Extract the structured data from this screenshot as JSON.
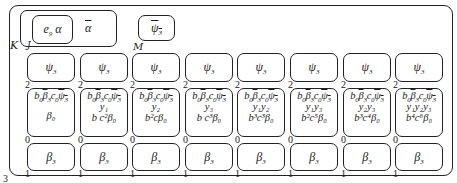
{
  "frame": {
    "outer_label": "3",
    "K_label": "K",
    "J_label": "J",
    "M_label": "M"
  },
  "top": {
    "inner_box": {
      "text": "e",
      "sub": "9",
      "greek": "α"
    },
    "alpha_bar": "α",
    "psi_bar": {
      "greek": "ψ",
      "sub": "3"
    }
  },
  "columns": [
    {
      "psi": "ψ",
      "psi_sub": "3",
      "psi_port": "2",
      "mid_vars": "",
      "mid_bottom": "β₀",
      "mid_port": "0",
      "beta": "β",
      "beta_sub": "3",
      "beta_port": "1"
    },
    {
      "psi": "ψ",
      "psi_sub": "3",
      "psi_port": "2",
      "mid_vars": "y₁",
      "mid_bottom": "b c²β₀",
      "mid_port": "0",
      "beta": "β",
      "beta_sub": "3",
      "beta_port": "1"
    },
    {
      "psi": "ψ",
      "psi_sub": "3",
      "psi_port": "2",
      "mid_vars": "y₂",
      "mid_bottom": "b²cβ₀",
      "mid_port": "0",
      "beta": "β",
      "beta_sub": "3",
      "beta_port": "1"
    },
    {
      "psi": "ψ",
      "psi_sub": "3",
      "psi_port": "2",
      "mid_vars": "y₃",
      "mid_bottom": "b c³β₀",
      "mid_port": "0",
      "beta": "β",
      "beta_sub": "3",
      "beta_port": "1"
    },
    {
      "psi": "ψ",
      "psi_sub": "3",
      "psi_port": "2",
      "mid_vars": "y₁y₂",
      "mid_bottom": "b³c³β₀",
      "mid_port": "0",
      "beta": "β",
      "beta_sub": "3",
      "beta_port": "1"
    },
    {
      "psi": "ψ",
      "psi_sub": "3",
      "psi_port": "2",
      "mid_vars": "y₁y₃",
      "mid_bottom": "b²c⁵β₀",
      "mid_port": "0",
      "beta": "β",
      "beta_sub": "3",
      "beta_port": "1"
    },
    {
      "psi": "ψ",
      "psi_sub": "3",
      "psi_port": "2",
      "mid_vars": "y₂y₃",
      "mid_bottom": "b³c⁴β₀",
      "mid_port": "0",
      "beta": "β",
      "beta_sub": "3",
      "beta_port": "1"
    },
    {
      "psi": "ψ",
      "psi_sub": "3",
      "psi_port": "2",
      "mid_vars": "y₁y₂y₃",
      "mid_bottom": "b⁴c⁶β₀",
      "mid_port": "0",
      "beta": "β",
      "beta_sub": "3",
      "beta_port": "1"
    }
  ],
  "mid_header": {
    "b": "b",
    "b_sub": "0",
    "beta": "β",
    "beta_sub": "3",
    "c": "c",
    "c_sub": "0",
    "psi": "ψ",
    "psi_sub": "3"
  }
}
